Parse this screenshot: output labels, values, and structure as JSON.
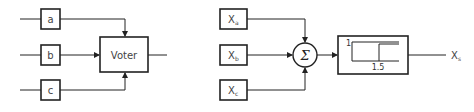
{
  "left_diagram": {
    "inputs": [
      {
        "label": "a"
      },
      {
        "label": "b"
      },
      {
        "label": "c"
      }
    ],
    "voter": {
      "label": "Voter"
    }
  },
  "right_diagram": {
    "inputs": [
      {
        "label": "X",
        "subscript": "a"
      },
      {
        "label": "X",
        "subscript": "b"
      },
      {
        "label": "X",
        "subscript": "c"
      }
    ],
    "summer": {
      "symbol": "Σ"
    },
    "threshold": {
      "high_label": "1",
      "threshold_label": "1.5"
    },
    "output": {
      "label": "X",
      "subscript": "s"
    }
  }
}
